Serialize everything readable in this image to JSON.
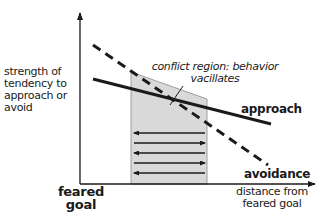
{
  "diagram": {
    "y_axis_label": "strength of tendency to approach or avoid",
    "x_axis_label": "distance from feared goal",
    "origin_label": "feared goal",
    "annotation": "conflict region: behavior vacillates",
    "curves": [
      {
        "name": "approach",
        "style": "solid",
        "from": [
          93,
          79
        ],
        "to": [
          271,
          124
        ]
      },
      {
        "name": "avoidance",
        "style": "dashed",
        "from": [
          93,
          45
        ],
        "to": [
          268,
          165
        ]
      }
    ],
    "conflict_region": {
      "x_start": 131,
      "x_end": 207,
      "fill": "#d9d9d9"
    },
    "vacillation_arrows": [
      {
        "y": 133,
        "direction": "left"
      },
      {
        "y": 143,
        "direction": "right"
      },
      {
        "y": 153,
        "direction": "left"
      },
      {
        "y": 163,
        "direction": "right"
      },
      {
        "y": 173,
        "direction": "left"
      }
    ],
    "colors": {
      "line": "#1a1a1a",
      "shade": "#d9d9d9"
    }
  }
}
